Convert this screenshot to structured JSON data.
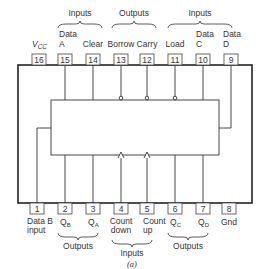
{
  "figure": {
    "caption": "(a)",
    "colors": {
      "line": "#222222",
      "text": "#333333",
      "background": "#ffffff"
    }
  },
  "groups": {
    "top": [
      {
        "label": "Inputs",
        "from_pin": 15,
        "to_pin": 14
      },
      {
        "label": "Outputs",
        "from_pin": 13,
        "to_pin": 12
      },
      {
        "label": "Inputs",
        "from_pin": 11,
        "to_pin": 9
      }
    ],
    "bottom": [
      {
        "label": "Outputs",
        "from_pin": 2,
        "to_pin": 3
      },
      {
        "label": "Inputs",
        "from_pin": 4,
        "to_pin": 5
      },
      {
        "label": "Outputs",
        "from_pin": 6,
        "to_pin": 7
      }
    ]
  },
  "top_pins": [
    {
      "number": "16",
      "label_line1": "",
      "label_line2": "V",
      "sub": "CC",
      "connection": "none"
    },
    {
      "number": "15",
      "label_line1": "Data",
      "label_line2": "A",
      "sub": "",
      "connection": "direct"
    },
    {
      "number": "14",
      "label_line1": "",
      "label_line2": "Clear",
      "sub": "",
      "connection": "direct"
    },
    {
      "number": "13",
      "label_line1": "",
      "label_line2": "Borrow",
      "sub": "",
      "connection": "inverted"
    },
    {
      "number": "12",
      "label_line1": "",
      "label_line2": "Carry",
      "sub": "",
      "connection": "inverted"
    },
    {
      "number": "11",
      "label_line1": "",
      "label_line2": "Load",
      "sub": "",
      "connection": "inverted"
    },
    {
      "number": "10",
      "label_line1": "Data",
      "label_line2": "C",
      "sub": "",
      "connection": "direct"
    },
    {
      "number": "9",
      "label_line1": "Data",
      "label_line2": "D",
      "sub": "",
      "connection": "side"
    }
  ],
  "bottom_pins": [
    {
      "number": "1",
      "label_line1": "Data B",
      "label_line2": "input",
      "sub": "",
      "connection": "side"
    },
    {
      "number": "2",
      "label_line1": "Q",
      "label_line2": "",
      "sub": "B",
      "connection": "direct"
    },
    {
      "number": "3",
      "label_line1": "Q",
      "label_line2": "",
      "sub": "A",
      "connection": "direct"
    },
    {
      "number": "4",
      "label_line1": "Count",
      "label_line2": "down",
      "sub": "",
      "connection": "edge"
    },
    {
      "number": "5",
      "label_line1": "Count",
      "label_line2": "up",
      "sub": "",
      "connection": "edge"
    },
    {
      "number": "6",
      "label_line1": "Q",
      "label_line2": "",
      "sub": "C",
      "connection": "direct"
    },
    {
      "number": "7",
      "label_line1": "Q",
      "label_line2": "",
      "sub": "D",
      "connection": "direct"
    },
    {
      "number": "8",
      "label_line1": "Gnd",
      "label_line2": "",
      "sub": "",
      "connection": "none"
    }
  ]
}
